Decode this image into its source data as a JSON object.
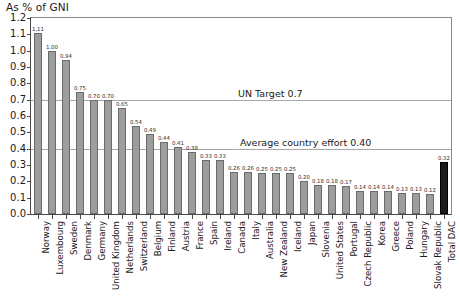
{
  "chart_data": {
    "type": "bar",
    "title": "As % of GNI",
    "xlabel": "",
    "ylabel": "",
    "ylim": [
      0.0,
      1.2
    ],
    "ytick_step": 0.1,
    "grid": "horizontal gridlines at 0.7 and 0.4 only",
    "legend": "none",
    "categories": [
      "Norway",
      "Luxembourg",
      "Sweden",
      "Denmark",
      "Germany",
      "United Kingdom",
      "Netherlands",
      "Switzerland",
      "Belgium",
      "Finland",
      "Austria",
      "France",
      "Spain",
      "Ireland",
      "Canada",
      "Italy",
      "Australia",
      "New Zealand",
      "Iceland",
      "Japan",
      "Slovenia",
      "United States",
      "Portugal",
      "Czech Republic",
      "Korea",
      "Greece",
      "Poland",
      "Hungary",
      "Slovak Republic",
      "Total DAC"
    ],
    "values": [
      1.11,
      1.0,
      0.94,
      0.75,
      0.7,
      0.7,
      0.65,
      0.54,
      0.49,
      0.44,
      0.41,
      0.38,
      0.33,
      0.33,
      0.26,
      0.26,
      0.25,
      0.25,
      0.25,
      0.2,
      0.18,
      0.18,
      0.17,
      0.14,
      0.14,
      0.14,
      0.13,
      0.13,
      0.12,
      0.32
    ],
    "value_labels": [
      "1,11",
      "1.00",
      "0.94",
      "0.75",
      "0.70",
      "0.70",
      "0.65",
      "0.54",
      "0.49",
      "0.44",
      "0.41",
      "0.38",
      "0.33",
      "0.33",
      "0.26",
      "0.26",
      "0.25",
      "0.25",
      "0.25",
      "0.20",
      "0.18",
      "0.18",
      "0.17",
      "0.14",
      "0.14",
      "0.14",
      "0.13",
      "0.13",
      "0.12",
      "0.32"
    ],
    "ytick_labels": [
      "0.0",
      "0.1",
      "0.2",
      "0.3",
      "0.4",
      "0.5",
      "0.6",
      "0.7",
      "0.8",
      "0.9",
      "1.0",
      "1.1",
      "1.2"
    ],
    "highlight_index": 29,
    "colors": {
      "bar": "#9d9d9d",
      "bar_border": "#6b6b6b",
      "highlight_bar": "#1b1b1b",
      "gridline": "#a6a6a6",
      "axis": "#4a4a4a",
      "text": "#1a1a1a",
      "background": "#ffffff"
    },
    "annotations": [
      {
        "text": "UN Target 0.7",
        "value": 0.7
      },
      {
        "text": "Average country effort 0.40",
        "value": 0.4
      }
    ]
  }
}
